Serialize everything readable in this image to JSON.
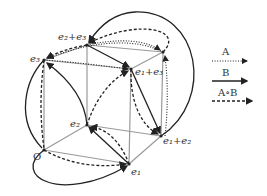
{
  "diagram": {
    "vertices": {
      "O": "O",
      "e1": "e₁",
      "e2": "e₂",
      "e3": "e₃",
      "e1_e2": "e₁+e₂",
      "e1_e3": "e₁+e₃",
      "e2_e3": "e₂+e₃"
    },
    "legend": {
      "a_label": "A",
      "b_label": "B",
      "aob_label": "A∘B",
      "a_style": "dotted",
      "b_style": "solid",
      "aob_style": "dashed"
    },
    "colors": {
      "cube_edges": "#9a9a9a",
      "arrows": "#222222"
    }
  }
}
